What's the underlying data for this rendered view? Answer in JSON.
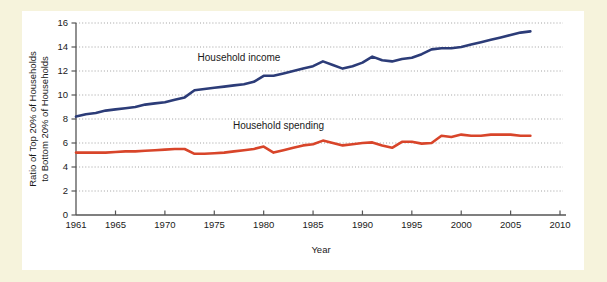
{
  "figure": {
    "background_color": "#f6f3dc",
    "panel_color": "#ffffff"
  },
  "chart_data": {
    "type": "line",
    "title": "",
    "xlabel": "Year",
    "ylabel": "Ratio of Top 20% of Households to Bottom 20% of Households",
    "ylabel_line1": "Ratio of Top 20% of Households",
    "ylabel_line2": "to Bottom 20% of Households",
    "xlim": [
      1961,
      2010
    ],
    "ylim": [
      0,
      16
    ],
    "xticks": [
      1961,
      1965,
      1970,
      1975,
      1980,
      1985,
      1990,
      1995,
      2000,
      2005,
      2010
    ],
    "xtick_labels": [
      "1961",
      "1965",
      "1970",
      "1975",
      "1980",
      "1985",
      "1990",
      "1995",
      "2000",
      "2005",
      "2010"
    ],
    "yticks": [
      0,
      2,
      4,
      6,
      8,
      10,
      12,
      14,
      16
    ],
    "ytick_labels": [
      "0",
      "2",
      "4",
      "6",
      "8",
      "10",
      "12",
      "14",
      "16"
    ],
    "grid": "horizontal-dotted",
    "legend_position": "in-plot-annotations",
    "series": [
      {
        "name": "Household income",
        "color": "#2c3c78",
        "label_x": 1977.5,
        "label_y": 12.85,
        "x": [
          1961,
          1962,
          1963,
          1964,
          1965,
          1966,
          1967,
          1968,
          1969,
          1970,
          1971,
          1972,
          1973,
          1974,
          1975,
          1976,
          1977,
          1978,
          1979,
          1980,
          1981,
          1982,
          1983,
          1984,
          1985,
          1986,
          1987,
          1988,
          1989,
          1990,
          1991,
          1992,
          1993,
          1994,
          1995,
          1996,
          1997,
          1998,
          1999,
          2000,
          2001,
          2002,
          2003,
          2004,
          2005,
          2006,
          2007
        ],
        "values": [
          8.2,
          8.4,
          8.5,
          8.7,
          8.8,
          8.9,
          9.0,
          9.2,
          9.3,
          9.4,
          9.6,
          9.8,
          10.4,
          10.5,
          10.6,
          10.7,
          10.8,
          10.9,
          11.1,
          11.6,
          11.6,
          11.8,
          12.0,
          12.2,
          12.4,
          12.8,
          12.5,
          12.2,
          12.4,
          12.7,
          13.2,
          12.9,
          12.8,
          13.0,
          13.1,
          13.4,
          13.8,
          13.9,
          13.9,
          14.0,
          14.2,
          14.4,
          14.6,
          14.8,
          15.0,
          15.2,
          15.3
        ]
      },
      {
        "name": "Household spending",
        "color": "#d8452a",
        "label_x": 1981.5,
        "label_y": 7.15,
        "x": [
          1961,
          1962,
          1963,
          1964,
          1965,
          1966,
          1967,
          1968,
          1969,
          1970,
          1971,
          1972,
          1973,
          1974,
          1975,
          1976,
          1977,
          1978,
          1979,
          1980,
          1981,
          1982,
          1983,
          1984,
          1985,
          1986,
          1987,
          1988,
          1989,
          1990,
          1991,
          1992,
          1993,
          1994,
          1995,
          1996,
          1997,
          1998,
          1999,
          2000,
          2001,
          2002,
          2003,
          2004,
          2005,
          2006,
          2007
        ],
        "values": [
          5.2,
          5.2,
          5.2,
          5.2,
          5.25,
          5.3,
          5.3,
          5.35,
          5.4,
          5.45,
          5.5,
          5.5,
          5.1,
          5.1,
          5.15,
          5.2,
          5.3,
          5.4,
          5.5,
          5.7,
          5.2,
          5.4,
          5.6,
          5.8,
          5.9,
          6.2,
          6.0,
          5.8,
          5.9,
          6.0,
          6.05,
          5.8,
          5.6,
          6.1,
          6.1,
          5.95,
          6.0,
          6.6,
          6.5,
          6.7,
          6.6,
          6.6,
          6.7,
          6.7,
          6.7,
          6.6,
          6.6
        ]
      }
    ]
  }
}
